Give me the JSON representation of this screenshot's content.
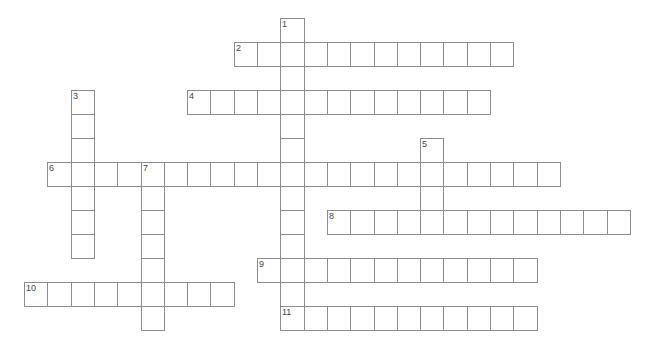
{
  "puzzle": {
    "type": "crossword",
    "grid": {
      "origin_x": 24,
      "origin_y": 18,
      "cell_width": 23.3,
      "cell_height": 24,
      "line_color": "#8c8c8c",
      "background": "#ffffff"
    },
    "entries": [
      {
        "number": "1",
        "direction": "down",
        "row": 0,
        "col": 11,
        "length": 13
      },
      {
        "number": "2",
        "direction": "across",
        "row": 1,
        "col": 9,
        "length": 12
      },
      {
        "number": "3",
        "direction": "down",
        "row": 3,
        "col": 2,
        "length": 7
      },
      {
        "number": "4",
        "direction": "across",
        "row": 3,
        "col": 7,
        "length": 13
      },
      {
        "number": "5",
        "direction": "down",
        "row": 5,
        "col": 17,
        "length": 4
      },
      {
        "number": "6",
        "direction": "across",
        "row": 6,
        "col": 1,
        "length": 22
      },
      {
        "number": "7",
        "direction": "down",
        "row": 6,
        "col": 5,
        "length": 7
      },
      {
        "number": "8",
        "direction": "across",
        "row": 8,
        "col": 13,
        "length": 13
      },
      {
        "number": "9",
        "direction": "across",
        "row": 10,
        "col": 10,
        "length": 12
      },
      {
        "number": "10",
        "direction": "across",
        "row": 11,
        "col": 0,
        "length": 9
      },
      {
        "number": "11",
        "direction": "across",
        "row": 12,
        "col": 11,
        "length": 11
      }
    ]
  }
}
